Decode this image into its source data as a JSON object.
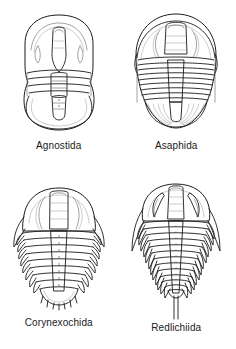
{
  "figure": {
    "background_color": "#ffffff",
    "line_color": "#1b1b1b",
    "label_color": "#1a1a1a",
    "layout": "2x2 grid",
    "panel_count": 4
  },
  "panels": [
    {
      "id": "agnostida",
      "label": "Agnostida",
      "position": "top-left",
      "cephalon": "rounded shield with central glabella and curved axial furrows",
      "thorax_segments": 3,
      "pygidium": "large rounded shield nearly equal in size to cephalon",
      "spines": "none",
      "outline_shape": "oval, isopygous"
    },
    {
      "id": "asaphida",
      "label": "Asaphida",
      "position": "top-right",
      "cephalon": "broad semicircular shield with wide tapering glabella and short genal angles",
      "thorax_segments": 8,
      "pygidium": "large fan-shaped shield with radiating pleural furrows",
      "spines": "short genal spines",
      "outline_shape": "broad oval"
    },
    {
      "id": "corynexochida",
      "label": "Corynexochida",
      "position": "bottom-left",
      "cephalon": "trapezoidal shield with parallel-sided glabella and backswept genal spines",
      "thorax_segments": 9,
      "pygidium": "small segmented shield with marginal spines",
      "spines": "genal spines and pygidial marginal spines",
      "outline_shape": "elongate oval with pointed pleural tips"
    },
    {
      "id": "redlichiida",
      "label": "Redlichiida",
      "position": "bottom-right",
      "cephalon": "wide shield with crescent-shaped eye ridges and long genal spines",
      "thorax_segments": 13,
      "pygidium": "very small, bearing a long terminal axial spine",
      "spines": "long genal spines and long telson spine",
      "outline_shape": "tapering, spinose"
    }
  ]
}
